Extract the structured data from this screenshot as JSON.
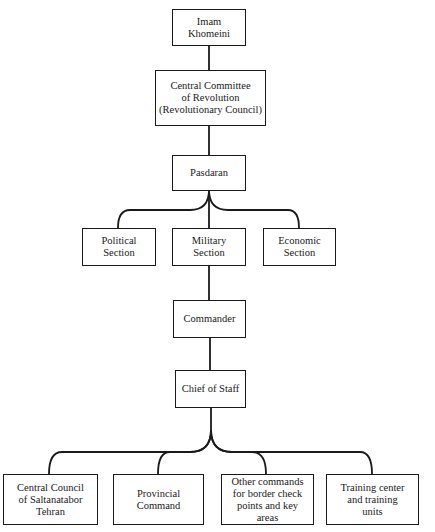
{
  "diagram": {
    "type": "org-chart",
    "nodes": {
      "imam": "Imam Khomeini",
      "central_committee": "Central Committee\nof Revolution\n(Revolutionary Council)",
      "pasdaran": "Pasdaran",
      "political": "Political\nSection",
      "military": "Military\nSection",
      "economic": "Economic\nSection",
      "commander": "Commander",
      "chief_of_staff": "Chief of Staff",
      "central_council": "Central Council\nof Saltanatabor\nTehran",
      "provincial": "Provincial\nCommand",
      "other_commands": "Other commands\nfor border check\npoints and key\nareas",
      "training": "Training center\nand training\nunits"
    },
    "edges": [
      [
        "imam",
        "central_committee"
      ],
      [
        "central_committee",
        "pasdaran"
      ],
      [
        "pasdaran",
        "political"
      ],
      [
        "pasdaran",
        "military"
      ],
      [
        "pasdaran",
        "economic"
      ],
      [
        "military",
        "commander"
      ],
      [
        "commander",
        "chief_of_staff"
      ],
      [
        "chief_of_staff",
        "central_council"
      ],
      [
        "chief_of_staff",
        "provincial"
      ],
      [
        "chief_of_staff",
        "other_commands"
      ],
      [
        "chief_of_staff",
        "training"
      ]
    ]
  }
}
